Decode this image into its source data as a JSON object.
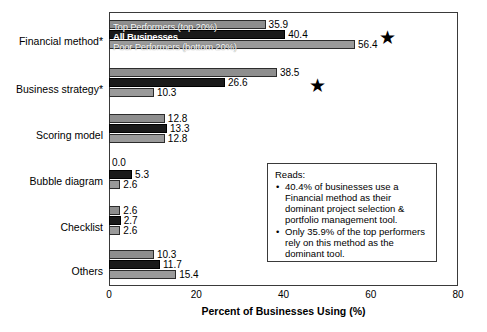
{
  "chart_data": {
    "type": "bar",
    "orientation": "horizontal",
    "title": "",
    "xlabel": "Percent of Businesses Using (%)",
    "ylabel": "",
    "xlim": [
      0,
      80
    ],
    "xticks": [
      0,
      20,
      40,
      60,
      80
    ],
    "grid": false,
    "legend_position": "overlaid-on-first-group",
    "categories": [
      "Financial method*",
      "Business strategy*",
      "Scoring model",
      "Bubble diagram",
      "Checklist",
      "Others"
    ],
    "series": [
      {
        "name": "Top Performers (top 20%)",
        "color": "#8e8e8e",
        "values": [
          35.9,
          38.5,
          12.8,
          0.0,
          2.6,
          10.3
        ]
      },
      {
        "name": "All Businesses",
        "color": "#1a1a1a",
        "values": [
          40.4,
          26.6,
          13.3,
          5.3,
          2.7,
          11.7
        ]
      },
      {
        "name": "Poor Performers (bottom 20%)",
        "color": "#9a9a9a",
        "values": [
          56.4,
          10.3,
          12.8,
          2.6,
          2.6,
          15.4
        ]
      }
    ],
    "annotations": [
      {
        "name": "star-financial-method",
        "glyph": "star",
        "x": 64.0,
        "category_index": 0
      },
      {
        "name": "star-business-strategy",
        "glyph": "star",
        "x": 48.0,
        "category_index": 1
      }
    ]
  },
  "reads_box": {
    "title": "Reads:",
    "bullets": [
      "40.4% of businesses use a Financial method as their dominant project selection & portfolio management tool.",
      "Only 35.9% of the top performers rely on this method as the dominant tool."
    ]
  }
}
